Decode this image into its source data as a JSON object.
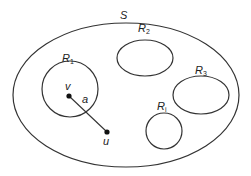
{
  "diagram": {
    "outer_set": {
      "label": "S"
    },
    "regions": [
      {
        "id": "R1",
        "label": "R",
        "subscript": "1"
      },
      {
        "id": "R2",
        "label": "R",
        "subscript": "2"
      },
      {
        "id": "R3",
        "label": "R",
        "subscript": "3"
      },
      {
        "id": "Ri",
        "label": "R",
        "subscript": "i"
      }
    ],
    "points": [
      {
        "id": "v",
        "label": "v"
      },
      {
        "id": "u",
        "label": "u"
      }
    ],
    "segment": {
      "label": "a",
      "from": "v",
      "to": "u"
    },
    "colors": {
      "stroke": "#333333",
      "background": "#ffffff"
    }
  }
}
